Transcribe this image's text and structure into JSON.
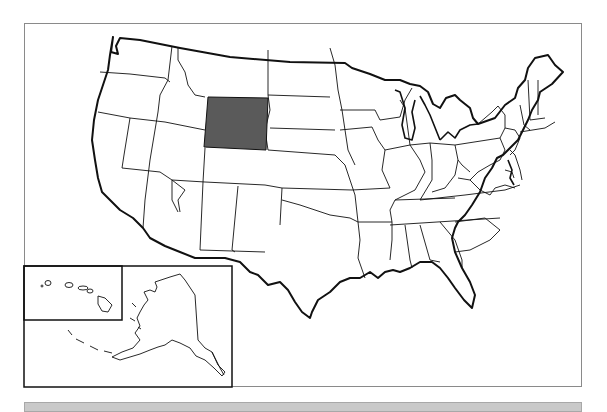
{
  "map": {
    "title": "United States",
    "highlighted_state": "Wyoming",
    "highlight_color": "#5a5a5a",
    "outline_color": "#111111",
    "background_color": "#ffffff",
    "insets": [
      "Alaska",
      "Hawaii"
    ]
  },
  "footer_bar": {
    "color": "#c9c9c9"
  }
}
